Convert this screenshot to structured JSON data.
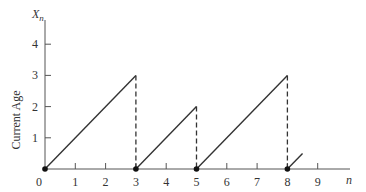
{
  "chart_data": {
    "type": "line",
    "title": "",
    "xlabel": "n",
    "ylabel": "Current Age",
    "y_symbol": "X",
    "y_symbol_sub": "n",
    "x_ticks": [
      "0",
      "1",
      "2",
      "3",
      "4",
      "5",
      "6",
      "7",
      "8",
      "9"
    ],
    "y_ticks": [
      "1",
      "2",
      "3",
      "4"
    ],
    "xlim": [
      0,
      10
    ],
    "ylim": [
      0,
      4.8
    ],
    "grid": false,
    "legend": null,
    "series": [
      {
        "name": "segment-1",
        "x": [
          0,
          3
        ],
        "y": [
          0,
          3
        ],
        "style": "solid"
      },
      {
        "name": "segment-2",
        "x": [
          3,
          5
        ],
        "y": [
          0,
          2
        ],
        "style": "solid"
      },
      {
        "name": "segment-3",
        "x": [
          5,
          8
        ],
        "y": [
          0,
          3
        ],
        "style": "solid"
      },
      {
        "name": "segment-4",
        "x": [
          8,
          8.5
        ],
        "y": [
          0,
          0.5
        ],
        "style": "solid"
      }
    ],
    "drops": [
      {
        "x": 3,
        "from": 3,
        "to": 0,
        "style": "dashed"
      },
      {
        "x": 5,
        "from": 2,
        "to": 0,
        "style": "dashed"
      },
      {
        "x": 8,
        "from": 3,
        "to": 0,
        "style": "dashed"
      }
    ],
    "renewal_points": [
      0,
      3,
      5,
      8
    ]
  },
  "colors": {
    "line": "#333333",
    "axis": "#555555"
  }
}
